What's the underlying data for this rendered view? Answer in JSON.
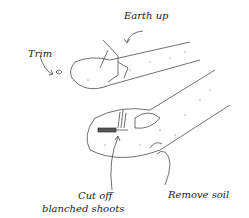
{
  "diagram": {
    "labels": {
      "earth_up": "Earth up",
      "trim": "Trim",
      "cut_off_line1": "Cut off",
      "cut_off_line2": "blanched shoots",
      "remove_soil": "Remove soil"
    },
    "colors": {
      "ink": "#222222",
      "background": "#ffffff"
    }
  }
}
